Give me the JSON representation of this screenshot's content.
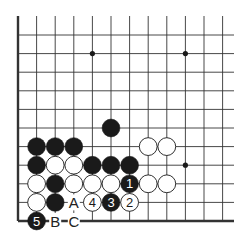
{
  "diagram": {
    "type": "go-board-fragment",
    "colors": {
      "line": "#333333",
      "black": "#1a1a1a",
      "white": "#ffffff",
      "label": "#222222"
    },
    "grid": {
      "columns": 12,
      "rows": 11,
      "edges": [
        "left",
        "bottom"
      ]
    },
    "star_points": [
      {
        "col": 4,
        "row": 9
      },
      {
        "col": 9,
        "row": 9
      },
      {
        "col": 9,
        "row": 3
      }
    ],
    "stones": [
      {
        "col": 5,
        "row": 5,
        "color": "black",
        "label": ""
      },
      {
        "col": 1,
        "row": 4,
        "color": "black",
        "label": ""
      },
      {
        "col": 2,
        "row": 4,
        "color": "black",
        "label": ""
      },
      {
        "col": 3,
        "row": 4,
        "color": "black",
        "label": ""
      },
      {
        "col": 7,
        "row": 4,
        "color": "white",
        "label": ""
      },
      {
        "col": 8,
        "row": 4,
        "color": "white",
        "label": ""
      },
      {
        "col": 1,
        "row": 3,
        "color": "black",
        "label": ""
      },
      {
        "col": 2,
        "row": 3,
        "color": "white",
        "label": ""
      },
      {
        "col": 3,
        "row": 3,
        "color": "white",
        "label": ""
      },
      {
        "col": 4,
        "row": 3,
        "color": "black",
        "label": ""
      },
      {
        "col": 5,
        "row": 3,
        "color": "black",
        "label": ""
      },
      {
        "col": 6,
        "row": 3,
        "color": "black",
        "label": ""
      },
      {
        "col": 1,
        "row": 2,
        "color": "white",
        "label": ""
      },
      {
        "col": 2,
        "row": 2,
        "color": "black",
        "label": ""
      },
      {
        "col": 3,
        "row": 2,
        "color": "white",
        "label": ""
      },
      {
        "col": 4,
        "row": 2,
        "color": "white",
        "label": ""
      },
      {
        "col": 5,
        "row": 2,
        "color": "white",
        "label": ""
      },
      {
        "col": 6,
        "row": 2,
        "color": "black",
        "label": "1"
      },
      {
        "col": 7,
        "row": 2,
        "color": "white",
        "label": ""
      },
      {
        "col": 8,
        "row": 2,
        "color": "white",
        "label": ""
      },
      {
        "col": 1,
        "row": 1,
        "color": "white",
        "label": ""
      },
      {
        "col": 2,
        "row": 1,
        "color": "black",
        "label": ""
      },
      {
        "col": 4,
        "row": 1,
        "color": "white",
        "label": "4"
      },
      {
        "col": 5,
        "row": 1,
        "color": "black",
        "label": "3"
      },
      {
        "col": 6,
        "row": 1,
        "color": "white",
        "label": "2"
      },
      {
        "col": 1,
        "row": 0,
        "color": "black",
        "label": "5"
      }
    ],
    "letter_marks": [
      {
        "col": 3,
        "row": 1,
        "text": "A"
      },
      {
        "col": 2,
        "row": 0,
        "text": "B"
      },
      {
        "col": 3,
        "row": 0,
        "text": "C"
      }
    ]
  }
}
